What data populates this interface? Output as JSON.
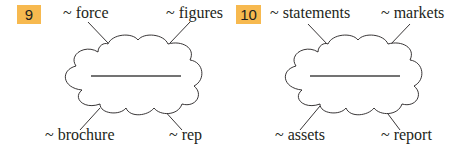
{
  "exercises": [
    {
      "number": "9",
      "answer_blank": "",
      "collocations": {
        "top_left": "~ force",
        "top_right": "~ figures",
        "bottom_left": "~ brochure",
        "bottom_right": "~ rep"
      }
    },
    {
      "number": "10",
      "answer_blank": "",
      "collocations": {
        "top_left": "~ statements",
        "top_right": "~ markets",
        "bottom_left": "~ assets",
        "bottom_right": "~ report"
      }
    }
  ],
  "colors": {
    "badge": "#f7b94f",
    "text": "#231f20",
    "line": "#231f20"
  }
}
